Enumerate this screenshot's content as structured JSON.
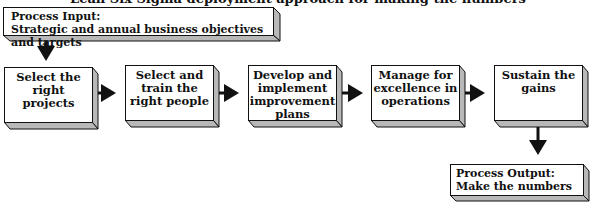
{
  "diagram": {
    "clipped_title": "Lean Six Sigma deployment approach for making the numbers",
    "input": {
      "label": "Process Input:",
      "text": "Strategic and annual business objectives and targets"
    },
    "steps": [
      {
        "lines": [
          "Select the",
          "right projects"
        ]
      },
      {
        "lines": [
          "Select and",
          "train the",
          "right people"
        ]
      },
      {
        "lines": [
          "Develop and",
          "implement",
          "improvement",
          "plans"
        ]
      },
      {
        "lines": [
          "Manage for",
          "excellence in",
          "operations"
        ]
      },
      {
        "lines": [
          "Sustain the",
          "gains"
        ]
      }
    ],
    "output": {
      "label": "Process Output:",
      "text": "Make the numbers"
    },
    "colors": {
      "face": "#ffffff",
      "side": "#b8b8b8",
      "stroke": "#111111"
    }
  }
}
